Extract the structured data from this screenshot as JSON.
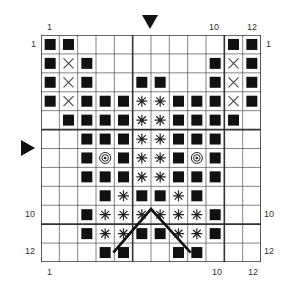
{
  "chart_data": {
    "type": "table",
    "columns": 12,
    "rows": 12,
    "legend_symbols": {
      "F": "filled-square",
      "X": "cross",
      "*": "asterisk",
      "O": "double-circle",
      ".": "empty"
    },
    "grid": [
      "FF........FF",
      "FXF......FXF",
      "FXF..FF..FXF",
      "FXFFF**FFFXF",
      ".FFFF**FFFF.",
      "..FFF**FFF..",
      "..FOF**FOF..",
      "..FFF**FFF..",
      "...F*FF*F...",
      "..F******F..",
      "..F**FF**F..",
      "...FF..FF..."
    ],
    "thick_lines_every": 5,
    "overlay_line": {
      "description": "inverted V from row 12 col 4-5 boundary to top of row 10 at col 6-7 boundary, down to row 12 col 8-9 boundary"
    },
    "markers": {
      "top_arrow_column": 7,
      "left_arrow_row": 6
    }
  },
  "labels": {
    "top_left_col": "1",
    "top_col_10": "10",
    "top_col_12": "12",
    "bottom_left_col": "1",
    "bottom_col_10": "10",
    "bottom_col_12": "12",
    "left_row_1": "1",
    "right_row_1": "1",
    "left_row_10": "10",
    "left_row_12": "12",
    "right_row_10": "10",
    "right_row_12": "12"
  }
}
